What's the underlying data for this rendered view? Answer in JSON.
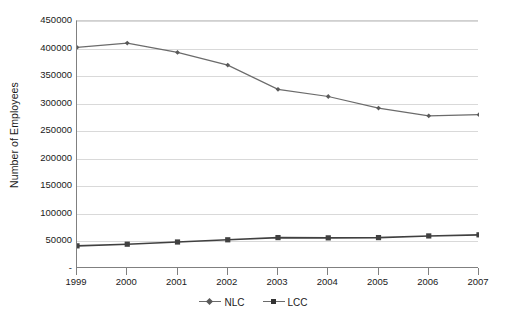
{
  "chart_data": {
    "type": "line",
    "title": "",
    "subtitle": "",
    "xlabel": "",
    "ylabel": "Number of Employees",
    "categories": [
      "1999",
      "2000",
      "2001",
      "2002",
      "2003",
      "2004",
      "2005",
      "2006",
      "2007"
    ],
    "series": [
      {
        "name": "NLC",
        "marker": "diamond",
        "color": "#6b6b6b",
        "values": [
          402000,
          410000,
          393000,
          370000,
          326000,
          313000,
          292000,
          278000,
          280000
        ]
      },
      {
        "name": "LCC",
        "marker": "square",
        "color": "#404040",
        "values": [
          42000,
          45000,
          49000,
          53000,
          57000,
          56500,
          57000,
          60000,
          62000
        ]
      }
    ],
    "ylim": [
      0,
      450000
    ],
    "ytick_values": [
      0,
      50000,
      100000,
      150000,
      200000,
      250000,
      300000,
      350000,
      400000,
      450000
    ],
    "ytick_labels": [
      "-",
      "50000",
      "100000",
      "150000",
      "200000",
      "250000",
      "300000",
      "350000",
      "400000",
      "450000"
    ],
    "grid": true,
    "grid_axis": "y",
    "legend_position": "bottom",
    "legend_entries": [
      "NLC",
      "LCC"
    ],
    "colors": {
      "gridline": "#d9d9d9",
      "axis": "#808080",
      "text": "#1a1a1a",
      "background": "#ffffff"
    }
  }
}
